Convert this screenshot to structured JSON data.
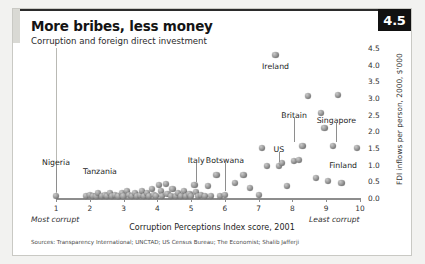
{
  "figure": {
    "number_badge": "4.5",
    "title": "More bribes, less money",
    "subtitle": "Corruption and foreign direct investment",
    "sources": "Sources: Transparency International; UNCTAD; US Census Bureau; The Economist; Shalib Jafferji"
  },
  "chart_data": {
    "type": "scatter",
    "title": "More bribes, less money",
    "subtitle": "Corruption and foreign direct investment",
    "xlabel": "Corruption Perceptions Index score, 2001",
    "ylabel": "FDI inflows per person, 2000, $'000",
    "xlim": [
      1,
      10
    ],
    "ylim": [
      0.0,
      4.5
    ],
    "xticks": [
      1,
      2,
      3,
      4,
      5,
      6,
      7,
      8,
      9,
      10
    ],
    "yticks": [
      0.0,
      0.5,
      1.0,
      1.5,
      2.0,
      2.5,
      3.0,
      3.5,
      4.0,
      4.5
    ],
    "ytick_labels": [
      "0.0",
      "0.5",
      "1.0",
      "1.5",
      "2.0",
      "2.5",
      "3.0",
      "3.5",
      "4.0",
      "4.5"
    ],
    "x_axis_end_notes": {
      "left": "Most corrupt",
      "right": "Least corrupt"
    },
    "grid": false,
    "legend": false,
    "annotations": [
      {
        "label": "Nigeria",
        "x": 1.0,
        "y": 0.05,
        "label_x": 1.0,
        "label_y": 1.05,
        "leader": true
      },
      {
        "label": "Tanzania",
        "x": 2.2,
        "y": 0.05,
        "label_x": 2.3,
        "label_y": 0.78,
        "leader": false
      },
      {
        "label": "Italy",
        "x": 5.5,
        "y": 0.35,
        "label_x": 5.15,
        "label_y": 1.12,
        "leader": true
      },
      {
        "label": "Botswana",
        "x": 6.0,
        "y": 0.08,
        "label_x": 6.0,
        "label_y": 1.12,
        "leader": true
      },
      {
        "label": "US",
        "x": 7.6,
        "y": 0.95,
        "label_x": 7.6,
        "label_y": 1.45,
        "leader": true
      },
      {
        "label": "Britain",
        "x": 8.3,
        "y": 1.55,
        "label_x": 8.05,
        "label_y": 2.45,
        "leader": true
      },
      {
        "label": "Singapore",
        "x": 9.2,
        "y": 1.55,
        "label_x": 9.3,
        "label_y": 2.32,
        "leader": true
      },
      {
        "label": "Finland",
        "x": 9.9,
        "y": 1.5,
        "label_x": 9.5,
        "label_y": 0.95,
        "leader": true
      },
      {
        "label": "Ireland",
        "x": 7.5,
        "y": 4.28,
        "label_x": 7.5,
        "label_y": 3.92,
        "leader": false
      }
    ],
    "points": [
      {
        "x": 1.0,
        "y": 0.05
      },
      {
        "x": 1.9,
        "y": 0.05
      },
      {
        "x": 2.0,
        "y": 0.1
      },
      {
        "x": 2.1,
        "y": 0.05
      },
      {
        "x": 2.2,
        "y": 0.05
      },
      {
        "x": 2.25,
        "y": 0.14
      },
      {
        "x": 2.35,
        "y": 0.05
      },
      {
        "x": 2.45,
        "y": 0.1
      },
      {
        "x": 2.5,
        "y": 0.05
      },
      {
        "x": 2.6,
        "y": 0.16
      },
      {
        "x": 2.65,
        "y": 0.05
      },
      {
        "x": 2.75,
        "y": 0.1
      },
      {
        "x": 2.85,
        "y": 0.05
      },
      {
        "x": 2.95,
        "y": 0.14
      },
      {
        "x": 3.0,
        "y": 0.05
      },
      {
        "x": 3.1,
        "y": 0.2
      },
      {
        "x": 3.15,
        "y": 0.08
      },
      {
        "x": 3.25,
        "y": 0.05
      },
      {
        "x": 3.35,
        "y": 0.16
      },
      {
        "x": 3.4,
        "y": 0.05
      },
      {
        "x": 3.5,
        "y": 0.1
      },
      {
        "x": 3.55,
        "y": 0.22
      },
      {
        "x": 3.6,
        "y": 0.05
      },
      {
        "x": 3.7,
        "y": 0.14
      },
      {
        "x": 3.75,
        "y": 0.05
      },
      {
        "x": 3.85,
        "y": 0.28
      },
      {
        "x": 3.9,
        "y": 0.1
      },
      {
        "x": 3.95,
        "y": 0.05
      },
      {
        "x": 4.05,
        "y": 0.4
      },
      {
        "x": 4.1,
        "y": 0.2
      },
      {
        "x": 4.15,
        "y": 0.05
      },
      {
        "x": 4.25,
        "y": 0.42
      },
      {
        "x": 4.3,
        "y": 0.12
      },
      {
        "x": 4.4,
        "y": 0.05
      },
      {
        "x": 4.45,
        "y": 0.26
      },
      {
        "x": 4.55,
        "y": 0.05
      },
      {
        "x": 4.6,
        "y": 0.16
      },
      {
        "x": 4.7,
        "y": 0.05
      },
      {
        "x": 4.8,
        "y": 0.22
      },
      {
        "x": 4.85,
        "y": 0.05
      },
      {
        "x": 4.95,
        "y": 0.12
      },
      {
        "x": 5.0,
        "y": 0.05
      },
      {
        "x": 5.1,
        "y": 0.4
      },
      {
        "x": 5.15,
        "y": 0.18
      },
      {
        "x": 5.2,
        "y": 0.05
      },
      {
        "x": 5.3,
        "y": 0.1
      },
      {
        "x": 5.4,
        "y": 0.05
      },
      {
        "x": 5.5,
        "y": 0.35
      },
      {
        "x": 5.6,
        "y": 0.05
      },
      {
        "x": 5.75,
        "y": 0.7
      },
      {
        "x": 5.85,
        "y": 0.05
      },
      {
        "x": 6.0,
        "y": 0.08
      },
      {
        "x": 6.3,
        "y": 0.45
      },
      {
        "x": 6.55,
        "y": 0.7
      },
      {
        "x": 6.75,
        "y": 0.3
      },
      {
        "x": 7.0,
        "y": 0.1
      },
      {
        "x": 7.1,
        "y": 1.5
      },
      {
        "x": 7.25,
        "y": 0.95
      },
      {
        "x": 7.5,
        "y": 4.28
      },
      {
        "x": 7.6,
        "y": 0.95
      },
      {
        "x": 7.7,
        "y": 1.05
      },
      {
        "x": 7.85,
        "y": 0.35
      },
      {
        "x": 8.05,
        "y": 1.1
      },
      {
        "x": 8.2,
        "y": 1.15
      },
      {
        "x": 8.3,
        "y": 1.55
      },
      {
        "x": 8.45,
        "y": 3.05
      },
      {
        "x": 8.7,
        "y": 0.6
      },
      {
        "x": 8.85,
        "y": 2.55
      },
      {
        "x": 8.95,
        "y": 2.1
      },
      {
        "x": 9.05,
        "y": 0.5
      },
      {
        "x": 9.2,
        "y": 1.55
      },
      {
        "x": 9.35,
        "y": 3.1
      },
      {
        "x": 9.45,
        "y": 0.45
      },
      {
        "x": 9.9,
        "y": 1.5
      }
    ]
  }
}
